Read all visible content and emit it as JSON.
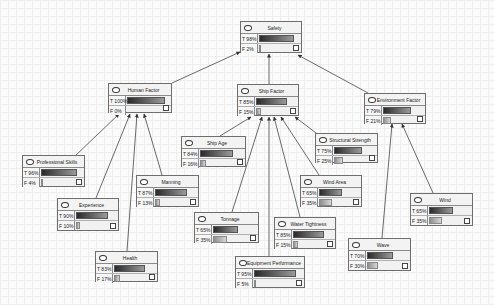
{
  "diagram": {
    "type": "bayesian-network",
    "nodes": [
      {
        "id": "safety",
        "label": "Safety",
        "t_label": "T 98%",
        "f_label": "F  2%",
        "t": 98,
        "f": 2,
        "x": 240,
        "y": 21,
        "w": 62,
        "h": 32
      },
      {
        "id": "human_factor",
        "label": "Human Factor",
        "t_label": "T 100%",
        "f_label": "F    0%",
        "t": 100,
        "f": 0,
        "x": 108,
        "y": 83,
        "w": 64,
        "h": 30
      },
      {
        "id": "ship_factor",
        "label": "Ship Factor",
        "t_label": "T 85%",
        "f_label": "F 15%",
        "t": 85,
        "f": 15,
        "x": 237,
        "y": 84,
        "w": 62,
        "h": 32
      },
      {
        "id": "environment_factor",
        "label": "Environment Factor",
        "t_label": "T 79%",
        "f_label": "F 21%",
        "t": 79,
        "f": 21,
        "x": 364,
        "y": 93,
        "w": 62,
        "h": 31
      },
      {
        "id": "ship_age",
        "label": "Ship Age",
        "t_label": "T 84%",
        "f_label": "F 16%",
        "t": 84,
        "f": 16,
        "x": 181,
        "y": 136,
        "w": 65,
        "h": 31
      },
      {
        "id": "structural_strength",
        "label": "Structural Strength",
        "t_label": "T 75%",
        "f_label": "F 25%",
        "t": 75,
        "f": 25,
        "x": 315,
        "y": 133,
        "w": 63,
        "h": 30
      },
      {
        "id": "professional_skills",
        "label": "Professional Skills",
        "t_label": "T 96%",
        "f_label": "F  4%",
        "t": 96,
        "f": 4,
        "x": 22,
        "y": 155,
        "w": 63,
        "h": 32
      },
      {
        "id": "manning",
        "label": "Manning",
        "t_label": "T 87%",
        "f_label": "F 13%",
        "t": 87,
        "f": 13,
        "x": 136,
        "y": 175,
        "w": 63,
        "h": 32
      },
      {
        "id": "wind_area",
        "label": "Wind Area",
        "t_label": "T 65%",
        "f_label": "F 35%",
        "t": 65,
        "f": 35,
        "x": 300,
        "y": 175,
        "w": 62,
        "h": 32
      },
      {
        "id": "experience",
        "label": "Experience",
        "t_label": "T 90%",
        "f_label": "F 10%",
        "t": 90,
        "f": 10,
        "x": 57,
        "y": 198,
        "w": 62,
        "h": 33
      },
      {
        "id": "wind",
        "label": "Wind",
        "t_label": "T 65%",
        "f_label": "F 35%",
        "t": 65,
        "f": 35,
        "x": 410,
        "y": 193,
        "w": 63,
        "h": 33
      },
      {
        "id": "tonnage",
        "label": "Tonnage",
        "t_label": "T 65%",
        "f_label": "F 35%",
        "t": 65,
        "f": 35,
        "x": 194,
        "y": 212,
        "w": 65,
        "h": 31
      },
      {
        "id": "water_tightness",
        "label": "Water Tightness",
        "t_label": "T 85%",
        "f_label": "F 15%",
        "t": 85,
        "f": 15,
        "x": 274,
        "y": 217,
        "w": 62,
        "h": 32
      },
      {
        "id": "wave",
        "label": "Wave",
        "t_label": "T 70%",
        "f_label": "F 30%",
        "t": 70,
        "f": 30,
        "x": 348,
        "y": 238,
        "w": 63,
        "h": 33
      },
      {
        "id": "health",
        "label": "Health",
        "t_label": "T 83%",
        "f_label": "F 17%",
        "t": 83,
        "f": 17,
        "x": 95,
        "y": 251,
        "w": 63,
        "h": 31
      },
      {
        "id": "equipment_performance",
        "label": "Equipment Performance",
        "t_label": "T 95%",
        "f_label": "F  5%",
        "t": 95,
        "f": 5,
        "x": 235,
        "y": 256,
        "w": 70,
        "h": 32
      }
    ],
    "edges": [
      {
        "from": "human_factor",
        "to": "safety",
        "x1": 172,
        "y1": 83,
        "x2": 240,
        "y2": 52
      },
      {
        "from": "ship_factor",
        "to": "safety",
        "x1": 269,
        "y1": 84,
        "x2": 269,
        "y2": 54
      },
      {
        "from": "environment_factor",
        "to": "safety",
        "x1": 368,
        "y1": 93,
        "x2": 298,
        "y2": 55
      },
      {
        "from": "professional_skills",
        "to": "human_factor",
        "x1": 75,
        "y1": 156,
        "x2": 119,
        "y2": 114
      },
      {
        "from": "experience",
        "to": "human_factor",
        "x1": 96,
        "y1": 198,
        "x2": 130,
        "y2": 114
      },
      {
        "from": "health",
        "to": "human_factor",
        "x1": 127,
        "y1": 251,
        "x2": 137,
        "y2": 114
      },
      {
        "from": "manning",
        "to": "human_factor",
        "x1": 162,
        "y1": 175,
        "x2": 144,
        "y2": 114
      },
      {
        "from": "ship_age",
        "to": "ship_factor",
        "x1": 220,
        "y1": 136,
        "x2": 251,
        "y2": 117
      },
      {
        "from": "tonnage",
        "to": "ship_factor",
        "x1": 232,
        "y1": 212,
        "x2": 262,
        "y2": 117
      },
      {
        "from": "equipment_performance",
        "to": "ship_factor",
        "x1": 269,
        "y1": 256,
        "x2": 269,
        "y2": 117
      },
      {
        "from": "water_tightness",
        "to": "ship_factor",
        "x1": 300,
        "y1": 217,
        "x2": 274,
        "y2": 117
      },
      {
        "from": "wind_area",
        "to": "ship_factor",
        "x1": 319,
        "y1": 175,
        "x2": 281,
        "y2": 117
      },
      {
        "from": "structural_strength",
        "to": "ship_factor",
        "x1": 320,
        "y1": 136,
        "x2": 295,
        "y2": 117
      },
      {
        "from": "wave",
        "to": "environment_factor",
        "x1": 382,
        "y1": 238,
        "x2": 392,
        "y2": 124
      },
      {
        "from": "wind",
        "to": "environment_factor",
        "x1": 433,
        "y1": 193,
        "x2": 402,
        "y2": 124
      }
    ]
  },
  "colors": {
    "node_border": "#6e6e6e",
    "node_fill": "#f1f1f1",
    "edge": "#444444",
    "background": "#fbfbfb"
  },
  "icons": {
    "node_state_icon": "ellipse",
    "node_check_icon": "checkbox"
  }
}
